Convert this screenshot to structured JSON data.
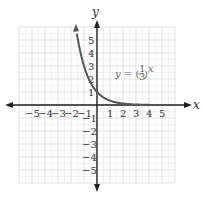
{
  "chart_data": {
    "type": "line",
    "title": "",
    "equation": "y = (1/3)^x",
    "equation_label": {
      "lhs": "y = (",
      "num": "1",
      "den": "3",
      "rhs": ")",
      "exp": "x"
    },
    "xlabel": "x",
    "ylabel": "y",
    "xlim": [
      -5,
      5
    ],
    "ylim": [
      -5,
      5
    ],
    "grid": true,
    "x_ticks": [
      "−5",
      "−4",
      "−3",
      "−2",
      "−1",
      "1",
      "2",
      "3",
      "4",
      "5"
    ],
    "y_ticks_pos": [
      "1",
      "2",
      "3",
      "4",
      "5"
    ],
    "y_ticks_neg": [
      "−1",
      "−2",
      "−3",
      "−4",
      "−5"
    ],
    "series": [
      {
        "name": "y = (1/3)^x",
        "x": [
          -1.6,
          -1.5,
          -1,
          -0.5,
          0,
          0.5,
          1,
          1.5,
          2,
          3,
          4,
          5,
          5.5
        ],
        "y": [
          5.8,
          5.196,
          3,
          1.732,
          1,
          0.577,
          0.333,
          0.192,
          0.111,
          0.037,
          0.012,
          0.004,
          0.002
        ]
      }
    ],
    "colors": {
      "curve": "#555555",
      "axis": "#222222",
      "grid": "#d8d8d8"
    }
  }
}
